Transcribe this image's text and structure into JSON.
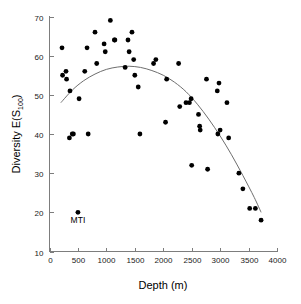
{
  "chart_data": {
    "type": "scatter",
    "title": "",
    "xlabel": "Depth (m)",
    "ylabel": "Diversity E(S",
    "ylabel_sub": "100",
    "ylabel_tail": ")",
    "xlim": [
      0,
      4000
    ],
    "ylim": [
      10,
      70
    ],
    "xticks": [
      0,
      500,
      1000,
      1500,
      2000,
      2500,
      3000,
      3500,
      4000
    ],
    "xticklabels": [
      "0",
      "500",
      "1000",
      "1500",
      "2000",
      "2500",
      "3000",
      "3500",
      "4000"
    ],
    "yticks": [
      10,
      20,
      30,
      40,
      50,
      60,
      70
    ],
    "yticklabels": [
      "10",
      "20",
      "30",
      "40",
      "50",
      "60",
      "70"
    ],
    "grid": false,
    "legend": null,
    "marker_color": "#000000",
    "curve_color": "#6e6e6e",
    "axis_color": "#7d7d7d",
    "points": [
      {
        "x": 220,
        "y": 62
      },
      {
        "x": 230,
        "y": 55
      },
      {
        "x": 290,
        "y": 56
      },
      {
        "x": 300,
        "y": 54
      },
      {
        "x": 350,
        "y": 39
      },
      {
        "x": 360,
        "y": 51
      },
      {
        "x": 400,
        "y": 40
      },
      {
        "x": 420,
        "y": 40
      },
      {
        "x": 500,
        "y": 20
      },
      {
        "x": 520,
        "y": 49
      },
      {
        "x": 620,
        "y": 56
      },
      {
        "x": 660,
        "y": 62
      },
      {
        "x": 680,
        "y": 40
      },
      {
        "x": 800,
        "y": 66
      },
      {
        "x": 830,
        "y": 58
      },
      {
        "x": 960,
        "y": 63
      },
      {
        "x": 980,
        "y": 61
      },
      {
        "x": 1070,
        "y": 69
      },
      {
        "x": 1140,
        "y": 64
      },
      {
        "x": 1150,
        "y": 64
      },
      {
        "x": 1330,
        "y": 57
      },
      {
        "x": 1380,
        "y": 64
      },
      {
        "x": 1400,
        "y": 61
      },
      {
        "x": 1450,
        "y": 66
      },
      {
        "x": 1480,
        "y": 59
      },
      {
        "x": 1500,
        "y": 55
      },
      {
        "x": 1560,
        "y": 52
      },
      {
        "x": 1590,
        "y": 40
      },
      {
        "x": 1830,
        "y": 58
      },
      {
        "x": 1870,
        "y": 59
      },
      {
        "x": 2040,
        "y": 43
      },
      {
        "x": 2060,
        "y": 54
      },
      {
        "x": 2270,
        "y": 58
      },
      {
        "x": 2290,
        "y": 47
      },
      {
        "x": 2400,
        "y": 48
      },
      {
        "x": 2460,
        "y": 48
      },
      {
        "x": 2490,
        "y": 49
      },
      {
        "x": 2500,
        "y": 32
      },
      {
        "x": 2620,
        "y": 45
      },
      {
        "x": 2640,
        "y": 42
      },
      {
        "x": 2650,
        "y": 41
      },
      {
        "x": 2760,
        "y": 54
      },
      {
        "x": 2780,
        "y": 31
      },
      {
        "x": 2950,
        "y": 51
      },
      {
        "x": 2960,
        "y": 40
      },
      {
        "x": 2980,
        "y": 53
      },
      {
        "x": 3000,
        "y": 41
      },
      {
        "x": 3120,
        "y": 48
      },
      {
        "x": 3150,
        "y": 39
      },
      {
        "x": 3330,
        "y": 30
      },
      {
        "x": 3400,
        "y": 26
      },
      {
        "x": 3520,
        "y": 21
      },
      {
        "x": 3620,
        "y": 21
      },
      {
        "x": 3720,
        "y": 18
      }
    ],
    "fit_curve": {
      "description": "quadratic-like smoothed trend",
      "points": [
        {
          "x": 200,
          "y": 48.0
        },
        {
          "x": 400,
          "y": 51.2
        },
        {
          "x": 600,
          "y": 53.6
        },
        {
          "x": 800,
          "y": 55.3
        },
        {
          "x": 1000,
          "y": 56.5
        },
        {
          "x": 1200,
          "y": 57.1
        },
        {
          "x": 1400,
          "y": 57.3
        },
        {
          "x": 1600,
          "y": 57.0
        },
        {
          "x": 1800,
          "y": 56.2
        },
        {
          "x": 2000,
          "y": 55.0
        },
        {
          "x": 2200,
          "y": 53.2
        },
        {
          "x": 2400,
          "y": 50.8
        },
        {
          "x": 2600,
          "y": 47.6
        },
        {
          "x": 2800,
          "y": 43.8
        },
        {
          "x": 3000,
          "y": 39.5
        },
        {
          "x": 3200,
          "y": 34.7
        },
        {
          "x": 3400,
          "y": 29.4
        },
        {
          "x": 3600,
          "y": 23.8
        },
        {
          "x": 3720,
          "y": 20.0
        }
      ]
    },
    "annotations": [
      {
        "label": "MTI",
        "x": 500,
        "y": 20,
        "position": "below"
      }
    ]
  }
}
